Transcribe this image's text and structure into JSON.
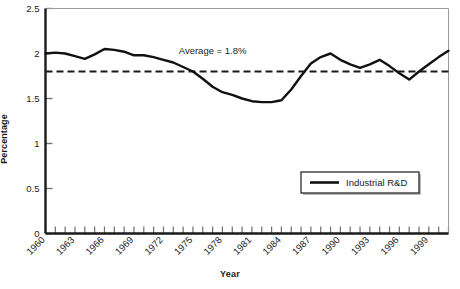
{
  "chart_data": {
    "type": "line",
    "title": "",
    "xlabel": "Year",
    "ylabel": "Percentage",
    "xlim": [
      1960,
      2001
    ],
    "ylim": [
      0,
      2.5
    ],
    "grid": false,
    "legend_position": "bottom-right",
    "y_ticks": [
      "0",
      "0.5",
      "1",
      "1.5",
      "2",
      "2.5"
    ],
    "y_tick_values": [
      0,
      0.5,
      1,
      1.5,
      2,
      2.5
    ],
    "x_ticks": [
      "1960",
      "1963",
      "1966",
      "1969",
      "1972",
      "1975",
      "1978",
      "1981",
      "1984",
      "1987",
      "1990",
      "1993",
      "1996",
      "1999"
    ],
    "x_tick_values": [
      1960,
      1963,
      1966,
      1969,
      1972,
      1975,
      1978,
      1981,
      1984,
      1987,
      1990,
      1993,
      1996,
      1999
    ],
    "annotations": [
      {
        "text": "Average = 1.8%",
        "x": 1977,
        "y": 2.0
      }
    ],
    "reference_lines": [
      {
        "label": "Average",
        "value": 1.8,
        "style": "dashed"
      }
    ],
    "series": [
      {
        "name": "Industrial R&D",
        "color": "#111111",
        "x": [
          1960,
          1961,
          1962,
          1963,
          1964,
          1965,
          1966,
          1967,
          1968,
          1969,
          1970,
          1971,
          1972,
          1973,
          1974,
          1975,
          1976,
          1977,
          1978,
          1979,
          1980,
          1981,
          1982,
          1983,
          1984,
          1985,
          1986,
          1987,
          1988,
          1989,
          1990,
          1991,
          1992,
          1993,
          1994,
          1995,
          1996,
          1997,
          1998,
          1999,
          2000,
          2001
        ],
        "values": [
          2.0,
          2.01,
          2.0,
          1.97,
          1.94,
          1.99,
          2.05,
          2.04,
          2.02,
          1.98,
          1.98,
          1.96,
          1.93,
          1.9,
          1.85,
          1.8,
          1.72,
          1.63,
          1.57,
          1.54,
          1.5,
          1.47,
          1.46,
          1.46,
          1.48,
          1.6,
          1.75,
          1.89,
          1.96,
          2.0,
          1.93,
          1.88,
          1.84,
          1.88,
          1.93,
          1.86,
          1.78,
          1.71,
          1.8,
          1.88,
          1.96,
          2.03
        ]
      }
    ]
  },
  "legend": {
    "entries": [
      {
        "label": "Industrial R&D",
        "color": "#111111"
      }
    ]
  },
  "axis_titles": {
    "x": "Year",
    "y": "Percentage"
  }
}
